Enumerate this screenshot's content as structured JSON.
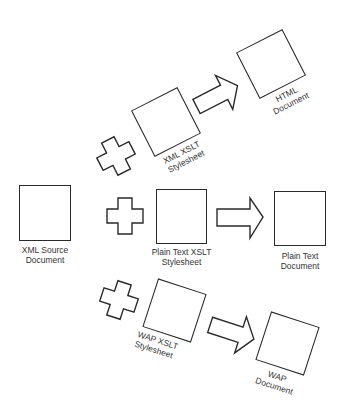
{
  "diagram": {
    "type": "xslt-transformation-flow",
    "colors": {
      "stroke": "#2a2a2a",
      "background": "#ffffff"
    },
    "source": {
      "label_line1": "XML Source",
      "label_line2": "Document"
    },
    "branches": [
      {
        "name": "xml",
        "operator_icon": "plus-icon",
        "stylesheet": {
          "label_line1": "XML XSLT",
          "label_line2": "Stylesheet"
        },
        "arrow_icon": "right-arrow-icon",
        "output": {
          "label_line1": "HTML",
          "label_line2": "Document"
        }
      },
      {
        "name": "plain-text",
        "operator_icon": "plus-icon",
        "stylesheet": {
          "label_line1": "Plain Text XSLT",
          "label_line2": "Stylesheet"
        },
        "arrow_icon": "right-arrow-icon",
        "output": {
          "label_line1": "Plain Text",
          "label_line2": "Document"
        }
      },
      {
        "name": "wap",
        "operator_icon": "plus-icon",
        "stylesheet": {
          "label_line1": "WAP XSLT",
          "label_line2": "Stylesheet"
        },
        "arrow_icon": "right-arrow-icon",
        "output": {
          "label_line1": "WAP",
          "label_line2": "Document"
        }
      }
    ]
  }
}
